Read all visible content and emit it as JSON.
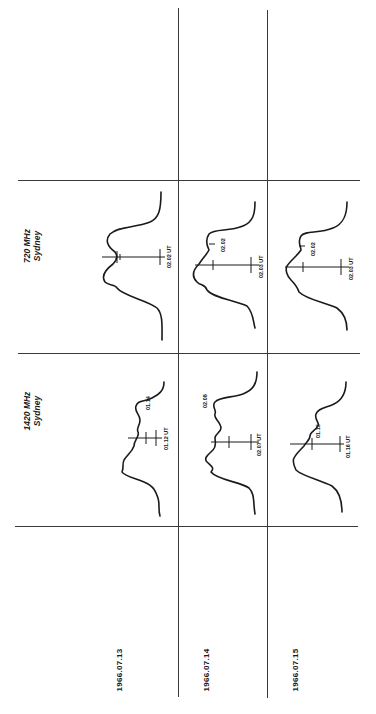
{
  "figure": {
    "orientation": "rotated 90 degrees counter-clockwise",
    "rows": [
      {
        "id": "720",
        "label_line1": "720 MHz",
        "label_line2": "Sydney"
      },
      {
        "id": "1420",
        "label_line1": "1420 MHz",
        "label_line2": "Sydney"
      }
    ],
    "dates": [
      "1966.07.13",
      "1966.07.14",
      "1966.07.15"
    ],
    "panels": {
      "720": [
        {
          "date": "1966.07.13",
          "peak_time": "",
          "ut_time": "02.02 UT"
        },
        {
          "date": "1966.07.14",
          "peak_time": "02.02",
          "ut_time": "02.03 UT"
        },
        {
          "date": "1966.07.15",
          "peak_time": "02.02",
          "ut_time": "02.03 UT"
        }
      ],
      "1420": [
        {
          "date": "1966.07.13",
          "peak_time": "01.14",
          "ut_time": "01.12 UT"
        },
        {
          "date": "1966.07.14",
          "peak_time": "02.08",
          "ut_time": "02.07 UT"
        },
        {
          "date": "1966.07.15",
          "peak_time": "01.15",
          "ut_time": "01.16 UT"
        }
      ]
    }
  }
}
